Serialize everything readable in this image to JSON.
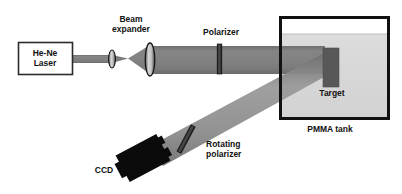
{
  "figure": {
    "width": 402,
    "height": 194,
    "background": "#ffffff"
  },
  "colors": {
    "beam_main": "#7d7d7d",
    "beam_scattered": "#8c8c8c",
    "beam_edge": "#6f6f6f",
    "tank_border": "#111111",
    "tank_water": "#d5d5d5",
    "tank_air": "#ffffff",
    "target_fill": "#585858",
    "ccd_fill": "#0b0b0b",
    "lens_fill": "#9a9a9a",
    "lens_stroke": "#1a1a1a",
    "polarizer_fill": "#3a3a3a",
    "box_stroke": "#2b2b2b",
    "box_fill": "#ffffff",
    "label_text": "#111111"
  },
  "labels": {
    "laser": {
      "line1": "He-Ne",
      "line2": "Laser",
      "x": 45,
      "y": 49
    },
    "beam_expander": {
      "line1": "Beam",
      "line2": "expander",
      "x": 131,
      "y": 16
    },
    "polarizer": {
      "text": "Polarizer",
      "x": 220,
      "y": 29
    },
    "target": {
      "text": "Target",
      "x": 331,
      "y": 90
    },
    "pmma_tank": {
      "text": "PMMA tank",
      "x": 329,
      "y": 125
    },
    "rotating_polarizer": {
      "line1": "Rotating",
      "line2": "polarizer",
      "x": 206,
      "y": 141
    },
    "ccd": {
      "text": "CCD",
      "x": 103,
      "y": 167
    }
  },
  "components": {
    "laser_box": {
      "name": "He-Ne Laser",
      "x": 18,
      "y": 42,
      "width": 54,
      "height": 32
    },
    "lens_small": {
      "name": "diverging lens",
      "cx": 112,
      "cy": 59,
      "rx": 3.2,
      "ry": 8.5
    },
    "lens_large": {
      "name": "collimating lens",
      "cx": 150,
      "cy": 59,
      "rx": 4.6,
      "ry": 16
    },
    "polarizer_bar": {
      "name": "Polarizer",
      "x": 217,
      "y": 44,
      "width": 4.5,
      "height": 30
    },
    "tank": {
      "name": "PMMA tank",
      "x": 279,
      "y": 16,
      "width": 111,
      "height": 104,
      "water_line_y": 34,
      "border_width": 3
    },
    "target_block": {
      "name": "Target",
      "x": 323,
      "y": 48,
      "width": 16,
      "height": 39
    },
    "rotating_polarizer_bar": {
      "name": "Rotating polarizer",
      "cx": 186,
      "cy": 139,
      "length": 28,
      "thickness": 4.5,
      "angle_deg": 26
    },
    "ccd_body": {
      "name": "CCD camera",
      "cx": 143,
      "cy": 159,
      "width": 46,
      "height": 30,
      "angle_deg": -27
    }
  },
  "beams": {
    "beam_laser_to_lens1": {
      "name": "collimated laser beam",
      "x1": 72,
      "y1": 55,
      "x2": 112,
      "y2": 55,
      "thickness": 8
    },
    "beam_focus": {
      "name": "converging and diverging beam between lenses",
      "from_x": 112,
      "to_x": 150,
      "waist_x": 128
    },
    "beam_expanded": {
      "name": "expanded collimated beam to tank",
      "x1": 150,
      "y1": 46,
      "x2": 325,
      "y2": 46,
      "height": 26
    },
    "beam_scattered": {
      "name": "scattered beam from target to CCD",
      "x1": 325,
      "y1": 62,
      "x2": 160,
      "y2": 155,
      "thickness": 17
    }
  }
}
